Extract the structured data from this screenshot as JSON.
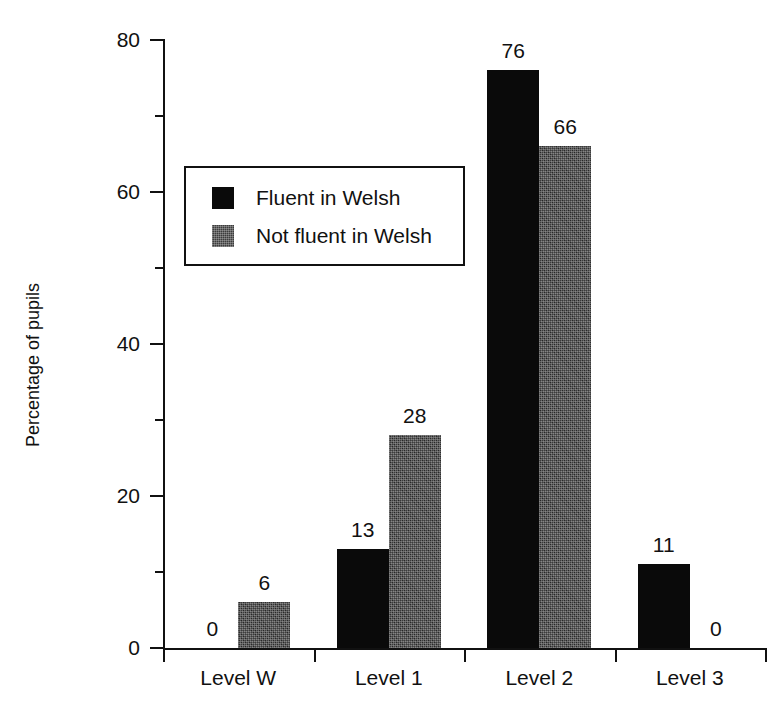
{
  "page_header": {
    "left_fragment": "",
    "middle_fragment": "",
    "right_fragment": ""
  },
  "chart_data": {
    "type": "bar",
    "title": "",
    "xlabel": "",
    "ylabel": "Percentage of pupils",
    "categories": [
      "Level W",
      "Level 1",
      "Level 2",
      "Level 3"
    ],
    "series": [
      {
        "name": "Fluent in Welsh",
        "values": [
          0,
          13,
          76,
          11
        ],
        "color": "#0a0a0a"
      },
      {
        "name": "Not fluent in Welsh",
        "values": [
          6,
          28,
          66,
          0
        ],
        "color": "#3c3c3c"
      }
    ],
    "ylim": [
      0,
      80
    ],
    "y_major_ticks": [
      0,
      20,
      40,
      60,
      80
    ],
    "y_minor_ticks": [
      10,
      30,
      50,
      70
    ],
    "grid": false,
    "legend_position": "upper-left-inside",
    "value_labels_shown": true
  },
  "axis": {
    "y_tick_labels": [
      "0",
      "20",
      "40",
      "60",
      "80"
    ],
    "y_title": "Percentage of pupils"
  },
  "legend": {
    "entries": [
      {
        "label": "Fluent in Welsh",
        "swatch": "black-square-swatch"
      },
      {
        "label": "Not fluent in Welsh",
        "swatch": "gray-textured-square-swatch"
      }
    ]
  },
  "groups": [
    {
      "label": "Level W",
      "bars": [
        {
          "series": "Fluent in Welsh",
          "value_label": "0"
        },
        {
          "series": "Not fluent in Welsh",
          "value_label": "6"
        }
      ]
    },
    {
      "label": "Level 1",
      "bars": [
        {
          "series": "Fluent in Welsh",
          "value_label": "13"
        },
        {
          "series": "Not fluent in Welsh",
          "value_label": "28"
        }
      ]
    },
    {
      "label": "Level 2",
      "bars": [
        {
          "series": "Fluent in Welsh",
          "value_label": "76"
        },
        {
          "series": "Not fluent in Welsh",
          "value_label": "66"
        }
      ]
    },
    {
      "label": "Level 3",
      "bars": [
        {
          "series": "Fluent in Welsh",
          "value_label": "11"
        },
        {
          "series": "Not fluent in Welsh",
          "value_label": "0"
        }
      ]
    }
  ]
}
